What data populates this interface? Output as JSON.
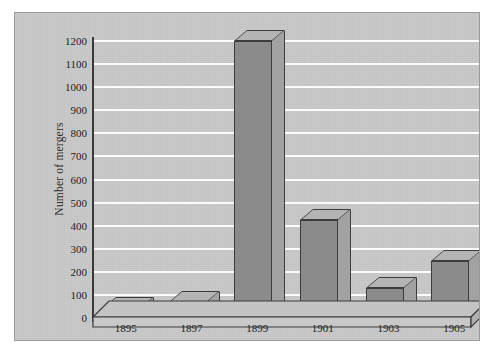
{
  "figure": {
    "panel_background": "#c9c9c9",
    "gridline_color": "#fbfbfb",
    "bar_front_color": "#8b8b8b",
    "bar_top_color": "#b4b4b4",
    "bar_side_color": "#a2a2a2",
    "outline_color": "#3c3c3c"
  },
  "chart_data": {
    "type": "bar",
    "title": "",
    "xlabel": "Year",
    "ylabel": "Number of mergers",
    "categories": [
      "1895",
      "1897",
      "1899",
      "1901",
      "1903",
      "1905"
    ],
    "values": [
      45,
      70,
      1200,
      425,
      130,
      245
    ],
    "ylim": [
      0,
      1200
    ],
    "ytick_labels": [
      "0",
      "100",
      "200",
      "300",
      "400",
      "500",
      "600",
      "700",
      "800",
      "900",
      "1000",
      "1100",
      "1200"
    ],
    "ytick_values": [
      0,
      100,
      200,
      300,
      400,
      500,
      600,
      700,
      800,
      900,
      1000,
      1100,
      1200
    ],
    "ytick_step": 100,
    "grid": true,
    "grid_axis": "y",
    "legend": null,
    "legend_position": "none",
    "three_d": true,
    "annotations": []
  }
}
